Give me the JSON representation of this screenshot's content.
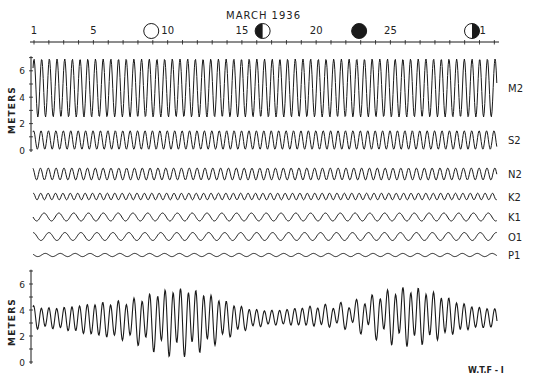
{
  "chart_data": {
    "type": "line",
    "title": "MARCH  1936",
    "xlabel": "Day of month",
    "ylabel": "METERS",
    "x_ticks": [
      "1",
      "5",
      "10",
      "15",
      "20",
      "25",
      "31"
    ],
    "x_range": [
      1,
      32
    ],
    "moon_phases": [
      {
        "day": 9.3,
        "phase": "full",
        "label": "full-moon"
      },
      {
        "day": 16.8,
        "phase": "last-quarter",
        "label": "last-quarter-moon"
      },
      {
        "day": 23.3,
        "phase": "new",
        "label": "new-moon"
      },
      {
        "day": 30.9,
        "phase": "first-quarter",
        "label": "first-quarter-moon"
      }
    ],
    "top_panel": {
      "ylabel": "METERS",
      "y_ticks": [
        "0",
        "2",
        "4",
        "6"
      ],
      "ylim": [
        0,
        7
      ]
    },
    "constituents": [
      {
        "name": "M2",
        "amplitude_m": 2.2,
        "period_hours": 12.42,
        "mean_m": 4.7
      },
      {
        "name": "S2",
        "amplitude_m": 0.7,
        "period_hours": 12.0,
        "mean_m": 0.75
      },
      {
        "name": "N2",
        "amplitude_m": 0.45,
        "period_hours": 12.66
      },
      {
        "name": "K2",
        "amplitude_m": 0.25,
        "period_hours": 11.97
      },
      {
        "name": "K1",
        "amplitude_m": 0.3,
        "period_hours": 23.93
      },
      {
        "name": "O1",
        "amplitude_m": 0.3,
        "period_hours": 25.82
      },
      {
        "name": "P1",
        "amplitude_m": 0.12,
        "period_hours": 24.07
      }
    ],
    "bottom_panel": {
      "series": "Predicted tide (sum of constituents)",
      "ylabel": "METERS",
      "y_ticks": [
        "0",
        "2",
        "4",
        "6"
      ],
      "ylim": [
        0,
        7
      ],
      "envelope_notes": "Spring tides near days 1 and 22-27 (range ~6 m), neap tides near days 8 and 17 (range ~2.5 m)"
    },
    "grid": false,
    "credit": "W.T.F - I"
  },
  "header": {
    "month_year": "MARCH   1936",
    "day_labels": [
      {
        "text": "1",
        "day": 1
      },
      {
        "text": "5",
        "day": 5
      },
      {
        "text": "10",
        "day": 10
      },
      {
        "text": "15",
        "day": 15
      },
      {
        "text": "20",
        "day": 20
      },
      {
        "text": "25",
        "day": 25
      },
      {
        "text": "31",
        "day": 31
      }
    ]
  },
  "labels": {
    "meters_top": "METERS",
    "meters_bottom": "METERS",
    "credit": "W.T.F - I"
  },
  "colors": {
    "ink": "#1a1a1a",
    "paper": "#ffffff"
  }
}
